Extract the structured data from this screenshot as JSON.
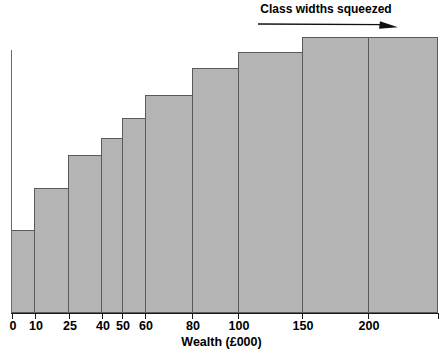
{
  "chart_data": {
    "type": "bar",
    "title": "",
    "subtitle": "",
    "xlabel": "Wealth (£000)",
    "ylabel": "",
    "grid": false,
    "legend": null,
    "xlim": [
      0,
      235
    ],
    "axis_tick_labels": [
      "0",
      "10",
      "25",
      "40",
      "50",
      "60",
      "80",
      "100",
      "150",
      "200"
    ],
    "bin_edges": [
      0,
      10,
      25,
      40,
      50,
      60,
      80,
      100,
      150,
      200,
      235
    ],
    "categories": [
      "0-10",
      "10-25",
      "25-40",
      "40-50",
      "50-60",
      "60-80",
      "80-100",
      "100-150",
      "150-200",
      "200+"
    ],
    "values": [
      83,
      125,
      158,
      175,
      195,
      218,
      245,
      261,
      276,
      276
    ],
    "value_units": "bar height in pixels (unlabelled frequency axis)",
    "annotations": [
      {
        "text": "Class widths squeezed",
        "arrow": "right",
        "x_start": 0,
        "x_end": 235
      }
    ],
    "colors": {
      "bar_fill": "#b4b4b4",
      "bar_outline": "#5a5a5a",
      "axis": "#1a1a1a",
      "text": "#000000"
    }
  },
  "axis": {
    "ticks": [
      {
        "label": "0",
        "x": 12
      },
      {
        "label": "10",
        "x": 35
      },
      {
        "label": "25",
        "x": 69
      },
      {
        "label": "40",
        "x": 102
      },
      {
        "label": "50",
        "x": 122
      },
      {
        "label": "60",
        "x": 145
      },
      {
        "label": "80",
        "x": 192
      },
      {
        "label": "100",
        "x": 238
      },
      {
        "label": "150",
        "x": 302
      },
      {
        "label": "200",
        "x": 368
      }
    ],
    "x_title": "Wealth (£000)"
  },
  "bars": [
    {
      "name": "bar-0-10",
      "left": 11,
      "width": 24,
      "top": 230
    },
    {
      "name": "bar-10-25",
      "left": 34,
      "width": 35,
      "top": 188
    },
    {
      "name": "bar-25-40",
      "left": 68,
      "width": 34,
      "top": 155
    },
    {
      "name": "bar-40-50",
      "left": 101,
      "width": 22,
      "top": 138
    },
    {
      "name": "bar-50-60",
      "left": 122,
      "width": 24,
      "top": 118
    },
    {
      "name": "bar-60-80",
      "left": 145,
      "width": 48,
      "top": 95
    },
    {
      "name": "bar-80-100",
      "left": 192,
      "width": 47,
      "top": 68
    },
    {
      "name": "bar-100-150",
      "left": 238,
      "width": 65,
      "top": 52
    },
    {
      "name": "bar-150-200",
      "left": 302,
      "width": 67,
      "top": 37
    },
    {
      "name": "bar-200-plus",
      "left": 368,
      "width": 70,
      "top": 37
    }
  ],
  "annotation": {
    "label": "Class widths squeezed"
  }
}
